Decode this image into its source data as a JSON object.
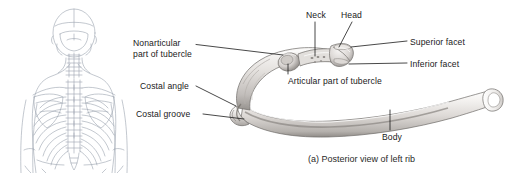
{
  "figure": {
    "caption": "(a) Posterior view of left rib",
    "background_color": "#ffffff",
    "line_color": "#1a1a1a",
    "skeleton_line_color": "#9aa3ae",
    "bone_fill_light": "#f2f0ee",
    "bone_fill_mid": "#d8d5d2",
    "bone_fill_dark": "#9e9a96"
  },
  "panels": {
    "orientation_figure": {
      "name": "posterior-skeleton-orientation-drawing",
      "description": "Posterior view of human upper torso skeleton"
    },
    "rib_illustration": {
      "name": "left-rib-posterior-illustration",
      "description": "Shaded drawing of a left rib seen from behind"
    }
  },
  "labels": {
    "nonarticular": "Nonarticular part of tubercle",
    "nonarticular_line1": "Nonarticular",
    "nonarticular_line2": "part of tubercle",
    "costal_angle": "Costal angle",
    "costal_groove": "Costal groove",
    "neck": "Neck",
    "head": "Head",
    "superior_facet": "Superior facet",
    "inferior_facet": "Inferior facet",
    "articular_part_of_tubercle": "Articular part of tubercle",
    "body": "Body"
  }
}
